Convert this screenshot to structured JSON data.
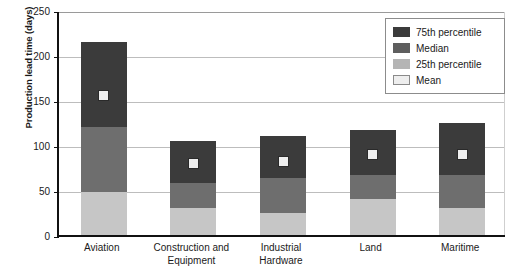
{
  "chart_data": {
    "type": "bar",
    "title": "",
    "subtitle": "",
    "xlabel": "",
    "ylabel": "Production lead time (days)",
    "ylim": [
      0,
      250
    ],
    "ytick_labels": [
      "250",
      "200",
      "150",
      "100",
      "50",
      "0"
    ],
    "ytick_values": [
      250,
      200,
      150,
      100,
      50,
      0
    ],
    "grid": true,
    "grid_axis": "y",
    "legend_position": "top-right",
    "categories": [
      "Aviation",
      "Construction and Equipment",
      "Industrial Hardware",
      "Land",
      "Maritime"
    ],
    "category_lines": [
      [
        "Aviation"
      ],
      [
        "Construction and",
        "Equipment"
      ],
      [
        "Industrial",
        "Hardware"
      ],
      [
        "Land"
      ],
      [
        "Maritime"
      ]
    ],
    "series": [
      {
        "name": "75th percentile",
        "values": [
          215,
          105,
          110,
          117,
          124
        ]
      },
      {
        "name": "Median",
        "values": [
          120,
          58,
          63,
          67,
          67
        ]
      },
      {
        "name": "25th percentile",
        "values": [
          48,
          30,
          24,
          40,
          30
        ]
      },
      {
        "name": "Mean",
        "values": [
          155,
          80,
          82,
          89,
          89
        ]
      }
    ],
    "colors": {
      "p75": "#3b3b3b",
      "median": "#6e6e6e",
      "p25": "#c6c6c6",
      "mean_fill": "#eeeeee",
      "mean_border": "#2a2a2a",
      "gridline": "#bdbdbd",
      "axis": "#111111",
      "background": "#ffffff"
    }
  },
  "legend": {
    "items": [
      {
        "label": "75th percentile",
        "swatch": "p75"
      },
      {
        "label": "Median",
        "swatch": "median"
      },
      {
        "label": "25th percentile",
        "swatch": "p25"
      },
      {
        "label": "Mean",
        "swatch": "mean"
      }
    ]
  }
}
